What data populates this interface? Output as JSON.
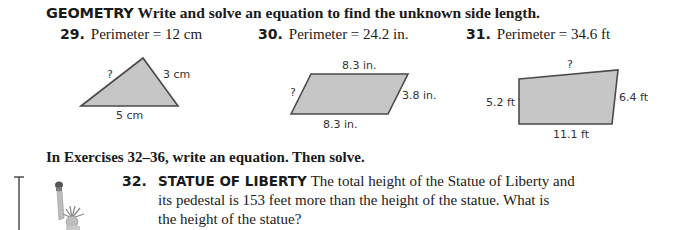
{
  "header": {
    "keyword": "GEOMETRY",
    "instruction": "Write and solve an equation to find the unknown side length."
  },
  "problems": [
    {
      "number": "29.",
      "statement": "Perimeter = 12 cm",
      "shape": "triangle",
      "labels": {
        "unknown": "?",
        "right": "3 cm",
        "bottom": "5 cm"
      }
    },
    {
      "number": "30.",
      "statement": "Perimeter = 24.2 in.",
      "shape": "parallelogram",
      "labels": {
        "top": "8.3 in.",
        "unknown": "?",
        "right": "3.8 in.",
        "bottom": "8.3 in."
      }
    },
    {
      "number": "31.",
      "statement": "Perimeter = 34.6 ft",
      "shape": "quadrilateral",
      "labels": {
        "unknown": "?",
        "left": "5.2 ft",
        "right": "6.4 ft",
        "bottom": "11.1 ft"
      }
    }
  ],
  "subheading": "In Exercises 32–36, write an equation. Then solve.",
  "exercise32": {
    "number": "32.",
    "keyword": "STATUE OF LIBERTY",
    "line1": "The total height of the Statue of Liberty and",
    "line2": "its pedestal is 153 feet more than the height of the statue. What is",
    "line3": "the height of the statue?"
  },
  "colors": {
    "shape_fill": "#c6c6c6",
    "shape_stroke": "#4a4a4a",
    "text": "#1a1a1a"
  }
}
